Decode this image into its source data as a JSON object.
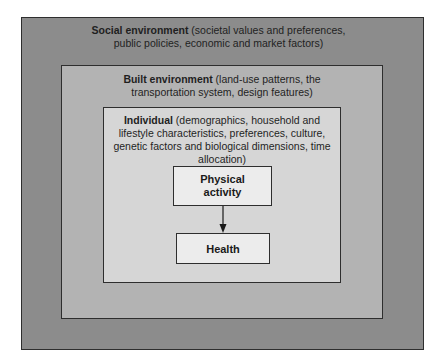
{
  "diagram": {
    "type": "nested-boxes",
    "layers": [
      {
        "id": "social",
        "title": "Social environment",
        "description": "(societal values and preferences, public policies, economic and market factors)",
        "line1_rest": " (societal values and preferences,",
        "line2": "public policies, economic and market factors)",
        "fill": "#8c8c8c"
      },
      {
        "id": "built",
        "title": "Built environment",
        "description": "(land-use patterns, the transportation system, design features)",
        "line1_rest": " (land-use patterns, the",
        "line2": "transportation system, design features)",
        "fill": "#b3b3b3"
      },
      {
        "id": "individual",
        "title": "Individual",
        "description": "(demographics, household and lifestyle characteristics, preferences, culture, genetic factors and biological dimensions, time allocation)",
        "line1_rest": " (demographics, household and",
        "line2": "lifestyle characteristics, preferences, culture,",
        "line3": "genetic factors and biological dimensions, time",
        "line4": "allocation)",
        "fill": "#d6d6d6"
      }
    ],
    "nodes": [
      {
        "id": "physical_activity",
        "line1": "Physical",
        "line2": "activity",
        "label": "Physical activity"
      },
      {
        "id": "health",
        "label": "Health"
      }
    ],
    "edges": [
      {
        "from": "physical_activity",
        "to": "health",
        "style": "arrow"
      }
    ]
  }
}
